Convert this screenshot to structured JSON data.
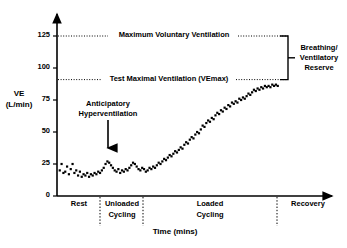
{
  "figure": {
    "title_visible": false,
    "background": "#ffffff",
    "ink": "#000000"
  },
  "axes": {
    "y_title_line1": "VE",
    "y_title_line2": "(L/min)",
    "x_title": "Time (mins)",
    "y_ticks": [
      "0",
      "25",
      "50",
      "75",
      "100",
      "125"
    ]
  },
  "annotations": {
    "mvv_label": "Maximum Voluntary Ventilation",
    "vemax_label": "Test Maximal Ventilation (VEmax)",
    "reserve_line1": "Breathing/",
    "reserve_line2": "Ventilatory",
    "reserve_line3": "Reserve",
    "anticipatory_line1": "Anticipatory",
    "anticipatory_line2": "Hyperventilation"
  },
  "phases": {
    "rest": "Rest",
    "unloaded_line1": "Unloaded",
    "unloaded_line2": "Cycling",
    "loaded_line1": "Loaded",
    "loaded_line2": "Cycling",
    "recovery": "Recovery"
  },
  "chart_data": {
    "type": "scatter",
    "title": "",
    "xlabel": "Time (mins)",
    "ylabel": "VE (L/min)",
    "ylim": [
      0,
      132
    ],
    "xlim": [
      0,
      100
    ],
    "yticks": [
      0,
      25,
      50,
      75,
      100,
      125
    ],
    "grid": false,
    "legend": "none",
    "marker": "square",
    "marker_color": "#000000",
    "reference_lines": [
      {
        "name": "Maximum Voluntary Ventilation",
        "value": 121,
        "style": "dotted",
        "label": "Maximum Voluntary Ventilation"
      },
      {
        "name": "Test Maximal Ventilation (VEmax)",
        "value": 87,
        "style": "dotted",
        "label": "Test Maximal Ventilation (VEmax)"
      }
    ],
    "bracket": {
      "from": 87,
      "to": 121,
      "label": "Breathing/Ventilatory Reserve"
    },
    "arrow_annotation": {
      "label": "Anticipatory Hyperventilation",
      "x": 21,
      "y_from": 52,
      "y_to": 33
    },
    "phase_boundaries": [
      {
        "label": "Rest",
        "x_start": 0,
        "x_end": 19
      },
      {
        "label": "Unloaded Cycling",
        "x_start": 19,
        "x_end": 38
      },
      {
        "label": "Loaded Cycling",
        "x_start": 38,
        "x_end": 97
      },
      {
        "label": "Recovery",
        "x_start": 97,
        "x_end": 100
      }
    ],
    "series": [
      {
        "name": "VE",
        "x": [
          1.2,
          2.0,
          2.8,
          3.6,
          4.4,
          5.2,
          6.0,
          6.8,
          7.6,
          8.4,
          9.2,
          10.0,
          10.8,
          11.6,
          12.4,
          13.2,
          14.0,
          14.8,
          15.6,
          16.4,
          17.2,
          18.0,
          18.8,
          19.6,
          20.4,
          21.2,
          22.0,
          22.8,
          23.6,
          24.4,
          25.2,
          26.0,
          26.8,
          27.6,
          28.4,
          29.2,
          30.0,
          30.8,
          31.6,
          32.4,
          33.2,
          34.0,
          34.8,
          35.6,
          36.4,
          37.2,
          38.0,
          38.8,
          39.6,
          40.4,
          41.2,
          42.0,
          42.8,
          43.6,
          44.4,
          45.2,
          46.0,
          46.8,
          47.6,
          48.4,
          49.2,
          50.0,
          50.8,
          51.6,
          52.4,
          53.2,
          54.0,
          54.8,
          55.6,
          56.4,
          57.2,
          58.0,
          58.8,
          59.6,
          60.4,
          61.2,
          62.0,
          62.8,
          63.6,
          64.4,
          65.2,
          66.0,
          66.8,
          67.6,
          68.4,
          69.2,
          70.0,
          70.8,
          71.6,
          72.4,
          73.2,
          74.0,
          74.8,
          75.6,
          76.4,
          77.2,
          78.0,
          78.8,
          79.6,
          80.4,
          81.2,
          82.0,
          82.8,
          83.6,
          84.4,
          85.2,
          86.0,
          86.8,
          87.6,
          88.4,
          89.2,
          90.0,
          90.8,
          91.6,
          92.4,
          93.2,
          94.0,
          94.8,
          95.6,
          96.4
        ],
        "y": [
          20,
          25,
          18,
          19,
          23,
          17,
          21,
          25,
          18,
          20,
          16,
          19,
          15,
          17,
          16,
          18,
          15,
          17,
          16,
          18,
          17,
          19,
          18,
          20,
          22,
          25,
          27,
          26,
          24,
          22,
          20,
          19,
          21,
          18,
          20,
          19,
          21,
          20,
          22,
          24,
          26,
          25,
          23,
          21,
          20,
          22,
          21,
          19,
          20,
          22,
          21,
          23,
          22,
          24,
          26,
          25,
          27,
          29,
          28,
          30,
          32,
          31,
          33,
          35,
          34,
          36,
          38,
          37,
          40,
          42,
          41,
          44,
          46,
          45,
          48,
          50,
          49,
          52,
          55,
          54,
          57,
          59,
          58,
          61,
          60,
          63,
          65,
          64,
          67,
          66,
          69,
          68,
          71,
          70,
          73,
          72,
          74,
          73,
          76,
          75,
          77,
          76,
          78,
          80,
          79,
          81,
          83,
          82,
          84,
          83,
          85,
          84,
          86,
          85,
          86,
          85,
          87,
          86,
          87,
          86
        ]
      }
    ]
  }
}
